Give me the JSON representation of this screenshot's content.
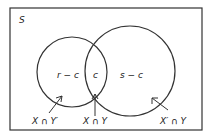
{
  "diagram": {
    "type": "venn",
    "universe_label": "S",
    "regions": [
      {
        "name": "x-only",
        "label": "r − c",
        "set_label": "X ∩ Y′"
      },
      {
        "name": "intersection",
        "label": "c",
        "set_label": "X ∩ Y"
      },
      {
        "name": "y-only",
        "label": "s − c",
        "set_label": "X′ ∩ Y"
      }
    ]
  },
  "colors": {
    "stroke": "#333333",
    "background": "#ffffff"
  }
}
